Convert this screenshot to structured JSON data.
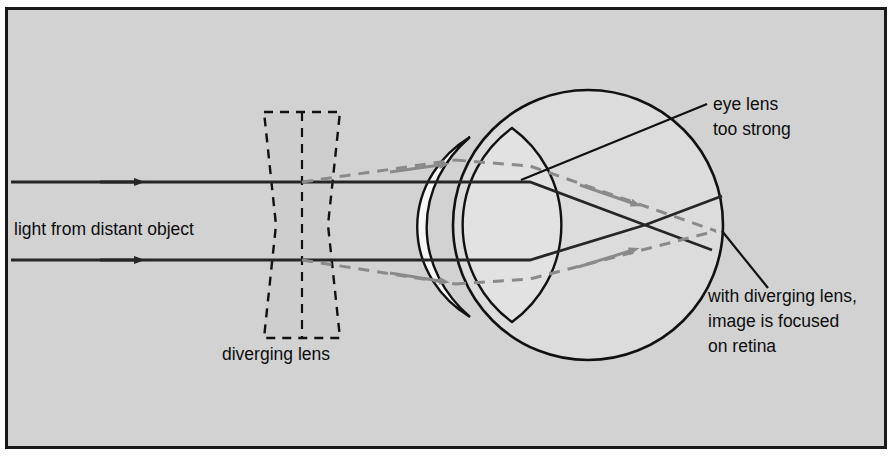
{
  "figure": {
    "background_color": "#d2d2d2",
    "page_color": "#ffffff",
    "frame_color": "#1a1a1a",
    "solid_ray_color": "#262626",
    "dashed_ray_color": "#8a8a8a",
    "outline_color": "#111111",
    "eye_fill_color": "#dcdcdc",
    "cornea_fill_color": "#f2f2f2",
    "lens_fill_color": "#e4e4e4",
    "diverging_lens_fill_color": "#cacaca"
  },
  "labels": {
    "incoming_light": "light from distant object",
    "diverging_lens": "diverging lens",
    "eye_lens_line1": "eye lens",
    "eye_lens_line2": "too strong",
    "correction_line1": "with diverging lens,",
    "correction_line2": "image is focused",
    "correction_line3": "on retina"
  },
  "elements": {
    "eyeball": "eyeball-circle",
    "cornea": "cornea-arc",
    "eye_lens": "eye-lens-shape",
    "diverging_lens": "diverging-lens-shape",
    "ray_top_solid": "solid-ray-upper",
    "ray_bottom_solid": "solid-ray-lower",
    "ray_top_dashed": "dashed-ray-upper",
    "ray_bottom_dashed": "dashed-ray-lower",
    "leader_eye_lens": "leader-line-eye-lens",
    "leader_correction": "leader-line-correction"
  }
}
